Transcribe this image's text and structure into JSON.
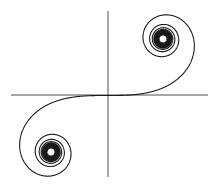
{
  "figure": {
    "name": "Cornu spiral (Euler spiral / clothoid)",
    "width": 218,
    "height": 186,
    "origin_px": [
      107,
      95.5
    ],
    "scale_px": [
      112,
      113
    ],
    "colors": {
      "background": "#ffffff",
      "curve": "#1a1a1a",
      "axes": "#3a3a3a"
    },
    "axes": {
      "horizontal": {
        "x1": 11,
        "x2": 208,
        "y": 95
      },
      "vertical": {
        "x": 108,
        "y1": 11,
        "y2": 177
      }
    },
    "curve": {
      "type": "parametric",
      "equation": "x = C(t), y = S(t) (Fresnel integrals)",
      "t_range": [
        -9,
        9
      ],
      "attractors": [
        [
          0.5,
          0.5
        ],
        [
          -0.5,
          -0.5
        ]
      ]
    }
  }
}
